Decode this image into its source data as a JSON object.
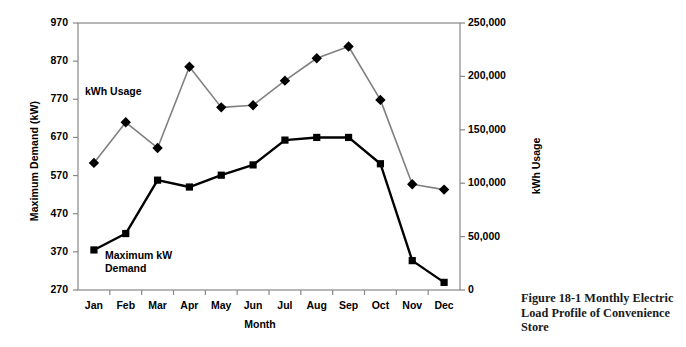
{
  "caption": "Figure 18-1 Monthly Electric Load Profile of Convenience Store",
  "axis_titles": {
    "left": "Maximum Demand (kW)",
    "right": "kWh Usage",
    "bottom": "Month"
  },
  "series_labels": {
    "kwh": "kWh Usage",
    "demand": "Maximum kW\nDemand"
  },
  "chart_data": {
    "type": "line",
    "title": "",
    "xlabel": "Month",
    "ylabel": "Maximum Demand (kW)",
    "y2label": "kWh Usage",
    "categories": [
      "Jan",
      "Feb",
      "Mar",
      "Apr",
      "May",
      "Jun",
      "Jul",
      "Aug",
      "Sep",
      "Oct",
      "Nov",
      "Dec"
    ],
    "ylim": [
      270,
      970
    ],
    "yticks": [
      270,
      370,
      470,
      570,
      670,
      770,
      870,
      970
    ],
    "ytick_labels": [
      "270",
      "370",
      "470",
      "570",
      "670",
      "770",
      "870",
      "970"
    ],
    "y2lim": [
      0,
      250000
    ],
    "y2ticks": [
      0,
      50000,
      100000,
      150000,
      200000,
      250000
    ],
    "y2tick_labels": [
      "0",
      "50,000",
      "100,000",
      "150,000",
      "200,000",
      "250,000"
    ],
    "grid": false,
    "legend": "inline-annotations",
    "series": [
      {
        "name": "kWh Usage",
        "axis": "right",
        "color": "#808080",
        "marker": "diamond",
        "marker_color": "#000000",
        "values": [
          119000,
          157000,
          133000,
          209000,
          171000,
          173000,
          196000,
          217000,
          228000,
          178000,
          99000,
          94000
        ]
      },
      {
        "name": "Maximum kW Demand",
        "axis": "left",
        "color": "#000000",
        "marker": "square",
        "marker_color": "#000000",
        "values": [
          375,
          418,
          558,
          540,
          571,
          598,
          663,
          670,
          670,
          601,
          347,
          290
        ]
      }
    ]
  }
}
